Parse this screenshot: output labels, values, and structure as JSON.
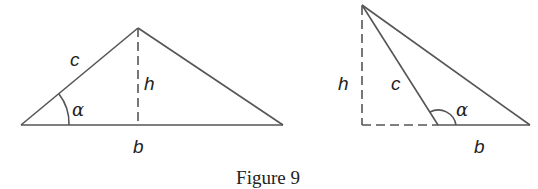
{
  "figure": {
    "caption": "Figure 9",
    "stroke_color": "#555555",
    "left_triangle": {
      "labels": {
        "side_c": "c",
        "height": "h",
        "angle": "α",
        "base": "b"
      },
      "vertices": {
        "left": [
          21,
          125
        ],
        "apex": [
          138,
          28
        ],
        "right": [
          283,
          125
        ]
      }
    },
    "right_triangle": {
      "labels": {
        "side_c": "c",
        "height": "h",
        "angle": "α",
        "base": "b"
      },
      "vertices": {
        "top": [
          362,
          5
        ],
        "foot": [
          362,
          125
        ],
        "obtuse": [
          438,
          125
        ],
        "right": [
          530,
          125
        ]
      }
    }
  }
}
